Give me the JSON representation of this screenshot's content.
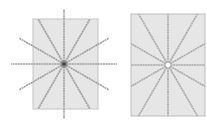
{
  "figures": [
    {
      "id": "left",
      "description": "Rectangle with 12 radial lines extending beyond the rectangle, dark center point",
      "ray_count": 12,
      "rays_clipped_to_rect": false,
      "center_marker": "dark-dot",
      "colors": {
        "rect_fill": "#e6e6e6",
        "rect_stroke": "#bdbdbd",
        "ray": "#9e9e9e",
        "center": "#333333"
      }
    },
    {
      "id": "right",
      "description": "Rectangle with 12 radial lines clipped at the rectangle edges, white center point",
      "ray_count": 12,
      "rays_clipped_to_rect": true,
      "center_marker": "white-dot",
      "colors": {
        "rect_fill": "#e6e6e6",
        "rect_stroke": "#bdbdbd",
        "ray": "#a8a8a8",
        "center": "#ffffff"
      }
    }
  ]
}
